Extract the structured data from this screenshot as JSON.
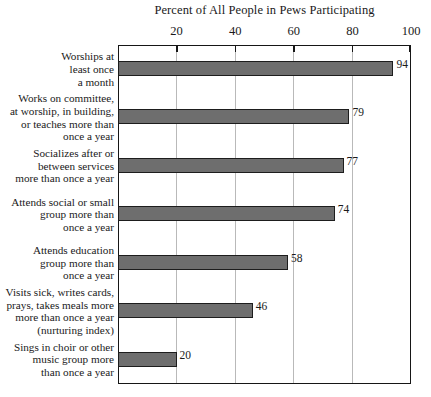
{
  "chart_data": {
    "type": "bar",
    "orientation": "horizontal",
    "title": "Percent of All People in Pews Participating",
    "xlabel": "",
    "ylabel": "",
    "xlim": [
      0,
      100
    ],
    "xticks": [
      20,
      40,
      60,
      80,
      100
    ],
    "grid": true,
    "legend": false,
    "bar_color": "#6e6e6e",
    "bar_border_color": "#1d1d1d",
    "axis_color": "#161616",
    "gridline_color": "#b9b9b9",
    "categories": [
      "Worships at least once a month",
      "Works on committee, at worship, in building, or teaches more than once a year",
      "Socializes after or between services more than once a year",
      "Attends social or small group more than once a year",
      "Attends education group more than once a year",
      "Visits sick, writes cards, prays, takes meals more more than once a year (nurturing index)",
      "Sings in choir or other music group more than once a year"
    ],
    "category_lines": [
      [
        "Worships at",
        "least once",
        "a month"
      ],
      [
        "Works on committee,",
        "at worship, in building,",
        "or teaches more than",
        "once a year"
      ],
      [
        "Socializes after or",
        "between services",
        "more than once a year"
      ],
      [
        "Attends social or small",
        "group more than",
        "once a year"
      ],
      [
        "Attends education",
        "group more than",
        "once a year"
      ],
      [
        "Visits sick, writes cards,",
        "prays, takes meals more",
        "more than once a year",
        "(nurturing index)"
      ],
      [
        "Sings in choir or other",
        "music group more",
        "than once a year"
      ]
    ],
    "values": [
      94,
      79,
      77,
      74,
      58,
      46,
      20
    ],
    "value_labels": [
      "94",
      "79",
      "77",
      "74",
      "58",
      "46",
      "20"
    ],
    "tick_labels": [
      "20",
      "40",
      "60",
      "80",
      "100"
    ]
  }
}
